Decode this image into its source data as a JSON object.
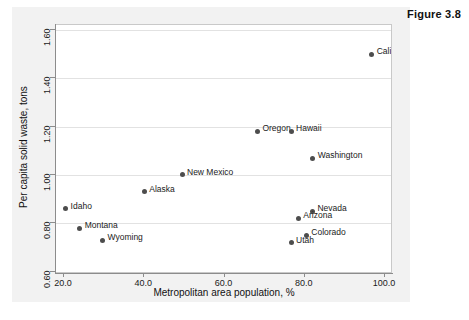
{
  "figure": {
    "caption": "Figure 3.8"
  },
  "chart_data": {
    "type": "scatter",
    "title": "",
    "xlabel": "Metropolitan area population, %",
    "ylabel": "Per capita solid waste, tons",
    "xlim": [
      18.0,
      102.0
    ],
    "ylim": [
      0.59,
      1.62
    ],
    "xticks": [
      "20.0",
      "40.0",
      "60.0",
      "80.0",
      "100.0"
    ],
    "xtick_values": [
      20.0,
      40.0,
      60.0,
      80.0,
      100.0
    ],
    "yticks": [
      "1.60",
      "1.40",
      "1.20",
      "1.00",
      "0.80",
      "0.60"
    ],
    "ytick_values": [
      1.6,
      1.4,
      1.2,
      1.0,
      0.8,
      0.6
    ],
    "grid": "horizontal",
    "legend": "none",
    "marker_color": "#4d4d4d",
    "points": [
      {
        "label": "California",
        "x": 96.7,
        "y": 1.5,
        "label_side": "right"
      },
      {
        "label": "Oregon",
        "x": 68.2,
        "y": 1.18,
        "label_side": "right"
      },
      {
        "label": "Hawaii",
        "x": 76.6,
        "y": 1.18,
        "label_side": "right"
      },
      {
        "label": "Washington",
        "x": 82.0,
        "y": 1.07,
        "label_side": "right"
      },
      {
        "label": "New Mexico",
        "x": 49.4,
        "y": 1.0,
        "label_side": "right"
      },
      {
        "label": "Alaska",
        "x": 40.0,
        "y": 0.93,
        "label_side": "right"
      },
      {
        "label": "Idaho",
        "x": 20.4,
        "y": 0.86,
        "label_side": "right"
      },
      {
        "label": "Nevada",
        "x": 81.9,
        "y": 0.85,
        "label_side": "right"
      },
      {
        "label": "Arizona",
        "x": 78.4,
        "y": 0.82,
        "label_side": "right"
      },
      {
        "label": "Montana",
        "x": 23.9,
        "y": 0.78,
        "label_side": "right"
      },
      {
        "label": "Colorado",
        "x": 80.4,
        "y": 0.75,
        "label_side": "right"
      },
      {
        "label": "Wyoming",
        "x": 29.6,
        "y": 0.73,
        "label_side": "right"
      },
      {
        "label": "Utah",
        "x": 76.6,
        "y": 0.72,
        "label_side": "right"
      }
    ]
  }
}
